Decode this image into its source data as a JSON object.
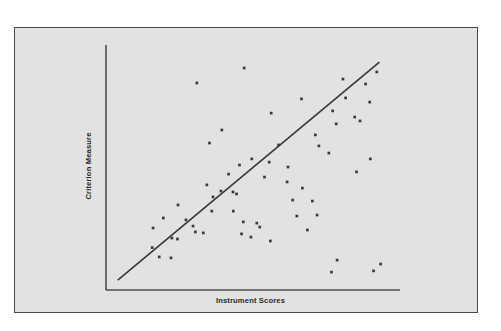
{
  "figure": {
    "background_color": "#e2e2e2",
    "frame_color": "#4a4a4a",
    "axis_color": "#4d4d4d",
    "point_color": "#3a3a3a",
    "line_color": "#3a3a3a"
  },
  "chart_data": {
    "type": "scatter",
    "title": "",
    "xlabel": "Instrument Scores",
    "ylabel": "Criterion Measure",
    "grid": false,
    "legend": null,
    "axis_ticks": {
      "x": [],
      "y": []
    },
    "xlim": [
      0,
      100
    ],
    "ylim": [
      0,
      100
    ],
    "trendline": {
      "name": "regression line",
      "x": [
        4,
        93
      ],
      "y": [
        4,
        93
      ]
    },
    "points": [
      {
        "x": 15.7,
        "y": 17.3
      },
      {
        "x": 18.1,
        "y": 13.5
      },
      {
        "x": 22.1,
        "y": 13.1
      },
      {
        "x": 16.0,
        "y": 25.3
      },
      {
        "x": 19.5,
        "y": 29.4
      },
      {
        "x": 24.3,
        "y": 20.8
      },
      {
        "x": 22.4,
        "y": 21.2
      },
      {
        "x": 24.5,
        "y": 34.7
      },
      {
        "x": 27.2,
        "y": 28.6
      },
      {
        "x": 29.6,
        "y": 26.1
      },
      {
        "x": 30.4,
        "y": 23.7
      },
      {
        "x": 33.1,
        "y": 23.3
      },
      {
        "x": 36.0,
        "y": 32.2
      },
      {
        "x": 36.4,
        "y": 38.0
      },
      {
        "x": 34.3,
        "y": 42.9
      },
      {
        "x": 39.1,
        "y": 40.4
      },
      {
        "x": 43.2,
        "y": 40.0
      },
      {
        "x": 44.4,
        "y": 39.2
      },
      {
        "x": 43.3,
        "y": 32.2
      },
      {
        "x": 46.7,
        "y": 27.8
      },
      {
        "x": 51.3,
        "y": 27.3
      },
      {
        "x": 52.3,
        "y": 25.7
      },
      {
        "x": 46.1,
        "y": 22.9
      },
      {
        "x": 49.3,
        "y": 21.6
      },
      {
        "x": 55.9,
        "y": 20.0
      },
      {
        "x": 41.7,
        "y": 47.3
      },
      {
        "x": 45.4,
        "y": 51.0
      },
      {
        "x": 49.6,
        "y": 53.5
      },
      {
        "x": 55.5,
        "y": 52.2
      },
      {
        "x": 53.9,
        "y": 46.1
      },
      {
        "x": 61.6,
        "y": 44.1
      },
      {
        "x": 66.8,
        "y": 41.6
      },
      {
        "x": 63.5,
        "y": 36.7
      },
      {
        "x": 70.2,
        "y": 36.3
      },
      {
        "x": 64.9,
        "y": 30.2
      },
      {
        "x": 71.8,
        "y": 30.6
      },
      {
        "x": 68.5,
        "y": 24.5
      },
      {
        "x": 78.6,
        "y": 12.2
      },
      {
        "x": 93.4,
        "y": 10.6
      },
      {
        "x": 91.0,
        "y": 7.8
      },
      {
        "x": 76.7,
        "y": 7.3
      },
      {
        "x": 39.4,
        "y": 65.3
      },
      {
        "x": 56.2,
        "y": 72.2
      },
      {
        "x": 71.2,
        "y": 63.3
      },
      {
        "x": 72.4,
        "y": 58.8
      },
      {
        "x": 75.8,
        "y": 55.9
      },
      {
        "x": 78.3,
        "y": 67.8
      },
      {
        "x": 77.1,
        "y": 73.1
      },
      {
        "x": 81.5,
        "y": 78.4
      },
      {
        "x": 84.6,
        "y": 70.6
      },
      {
        "x": 86.4,
        "y": 69.0
      },
      {
        "x": 89.7,
        "y": 76.7
      },
      {
        "x": 80.6,
        "y": 86.1
      },
      {
        "x": 88.3,
        "y": 84.1
      },
      {
        "x": 92.1,
        "y": 89.0
      },
      {
        "x": 85.2,
        "y": 48.2
      },
      {
        "x": 89.9,
        "y": 53.5
      },
      {
        "x": 30.9,
        "y": 84.5
      },
      {
        "x": 47.0,
        "y": 90.6
      },
      {
        "x": 66.5,
        "y": 78.0
      },
      {
        "x": 61.9,
        "y": 50.2
      },
      {
        "x": 58.7,
        "y": 59.2
      },
      {
        "x": 35.2,
        "y": 60.0
      }
    ]
  }
}
